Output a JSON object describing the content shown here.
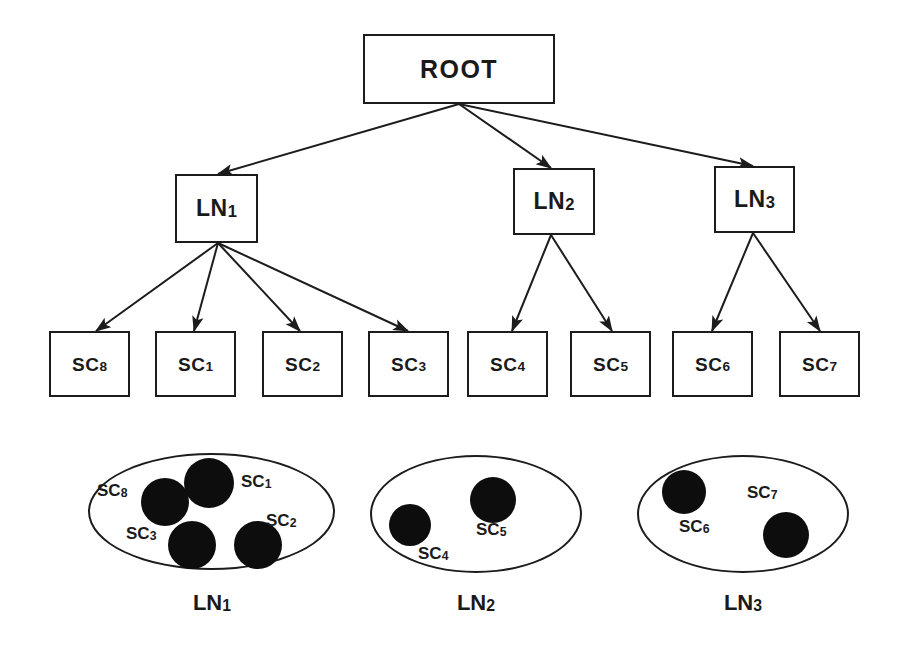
{
  "diagram": {
    "stroke_color": "#1c1c1c",
    "dot_color": "#0d0d0d",
    "background_color": "#ffffff"
  },
  "tree": {
    "root": {
      "id": "root",
      "label": "ROOT",
      "x": 363,
      "y": 34,
      "w": 192,
      "h": 70
    },
    "level_nodes": [
      {
        "id": "ln1",
        "label": "LN",
        "sub": "1",
        "x": 175,
        "y": 174,
        "w": 83,
        "h": 69
      },
      {
        "id": "ln2",
        "label": "LN",
        "sub": "2",
        "x": 513,
        "y": 168,
        "w": 82,
        "h": 67
      },
      {
        "id": "ln3",
        "label": "LN",
        "sub": "3",
        "x": 714,
        "y": 166,
        "w": 81,
        "h": 67
      }
    ],
    "service_components": [
      {
        "id": "sc8",
        "label": "SC",
        "sub": "8",
        "x": 49,
        "y": 331,
        "w": 81,
        "h": 66,
        "parent": "ln1"
      },
      {
        "id": "sc1",
        "label": "SC",
        "sub": "1",
        "x": 155,
        "y": 331,
        "w": 81,
        "h": 66,
        "parent": "ln1"
      },
      {
        "id": "sc2",
        "label": "SC",
        "sub": "2",
        "x": 262,
        "y": 331,
        "w": 81,
        "h": 66,
        "parent": "ln1"
      },
      {
        "id": "sc3",
        "label": "SC",
        "sub": "3",
        "x": 368,
        "y": 331,
        "w": 81,
        "h": 66,
        "parent": "ln1"
      },
      {
        "id": "sc4",
        "label": "SC",
        "sub": "4",
        "x": 467,
        "y": 331,
        "w": 81,
        "h": 66,
        "parent": "ln2"
      },
      {
        "id": "sc5",
        "label": "SC",
        "sub": "5",
        "x": 570,
        "y": 331,
        "w": 81,
        "h": 66,
        "parent": "ln2"
      },
      {
        "id": "sc6",
        "label": "SC",
        "sub": "6",
        "x": 672,
        "y": 331,
        "w": 81,
        "h": 66,
        "parent": "ln3"
      },
      {
        "id": "sc7",
        "label": "SC",
        "sub": "7",
        "x": 779,
        "y": 331,
        "w": 81,
        "h": 66,
        "parent": "ln3"
      }
    ],
    "edges": [
      {
        "from": "root",
        "to": "ln1",
        "x1": 459,
        "y1": 104,
        "x2": 218,
        "y2": 174
      },
      {
        "from": "root",
        "to": "ln2",
        "x1": 459,
        "y1": 104,
        "x2": 551,
        "y2": 168
      },
      {
        "from": "root",
        "to": "ln3",
        "x1": 459,
        "y1": 104,
        "x2": 753,
        "y2": 166
      },
      {
        "from": "ln1",
        "to": "sc8",
        "x1": 218,
        "y1": 243,
        "x2": 96,
        "y2": 331
      },
      {
        "from": "ln1",
        "to": "sc1",
        "x1": 218,
        "y1": 243,
        "x2": 194,
        "y2": 331
      },
      {
        "from": "ln1",
        "to": "sc2",
        "x1": 218,
        "y1": 243,
        "x2": 300,
        "y2": 331
      },
      {
        "from": "ln1",
        "to": "sc3",
        "x1": 218,
        "y1": 243,
        "x2": 408,
        "y2": 331
      },
      {
        "from": "ln2",
        "to": "sc4",
        "x1": 551,
        "y1": 235,
        "x2": 512,
        "y2": 331
      },
      {
        "from": "ln2",
        "to": "sc5",
        "x1": 551,
        "y1": 235,
        "x2": 612,
        "y2": 331
      },
      {
        "from": "ln3",
        "to": "sc6",
        "x1": 753,
        "y1": 233,
        "x2": 712,
        "y2": 331
      },
      {
        "from": "ln3",
        "to": "sc7",
        "x1": 753,
        "y1": 233,
        "x2": 820,
        "y2": 331
      }
    ]
  },
  "groups": [
    {
      "id": "group-ln1",
      "caption": "LN",
      "caption_sub": "1",
      "ellipse": {
        "x": 88,
        "y": 453,
        "w": 247,
        "h": 117
      },
      "caption_pos": {
        "x": 172,
        "y": 592,
        "w": 80
      },
      "members": [
        {
          "id": "sc8",
          "label": "SC",
          "sub": "8",
          "dot": {
            "cx": 165,
            "cy": 502,
            "r": 24
          },
          "label_pos": {
            "x": 97,
            "y": 482
          }
        },
        {
          "id": "sc1",
          "label": "SC",
          "sub": "1",
          "dot": {
            "cx": 209,
            "cy": 483,
            "r": 25
          },
          "label_pos": {
            "x": 241,
            "y": 473
          }
        },
        {
          "id": "sc3",
          "label": "SC",
          "sub": "3",
          "dot": {
            "cx": 192,
            "cy": 545,
            "r": 24
          },
          "label_pos": {
            "x": 126,
            "y": 525
          }
        },
        {
          "id": "sc2",
          "label": "SC",
          "sub": "2",
          "dot": {
            "cx": 258,
            "cy": 545,
            "r": 24
          },
          "label_pos": {
            "x": 266,
            "y": 512
          }
        }
      ]
    },
    {
      "id": "group-ln2",
      "caption": "LN",
      "caption_sub": "2",
      "ellipse": {
        "x": 370,
        "y": 455,
        "w": 212,
        "h": 118
      },
      "caption_pos": {
        "x": 436,
        "y": 592,
        "w": 80
      },
      "members": [
        {
          "id": "sc4",
          "label": "SC",
          "sub": "4",
          "dot": {
            "cx": 410,
            "cy": 525,
            "r": 21
          },
          "label_pos": {
            "x": 418,
            "y": 545
          }
        },
        {
          "id": "sc5",
          "label": "SC",
          "sub": "5",
          "dot": {
            "cx": 493,
            "cy": 500,
            "r": 23
          },
          "label_pos": {
            "x": 476,
            "y": 521
          }
        }
      ]
    },
    {
      "id": "group-ln3",
      "caption": "LN",
      "caption_sub": "3",
      "ellipse": {
        "x": 637,
        "y": 455,
        "w": 212,
        "h": 118
      },
      "caption_pos": {
        "x": 703,
        "y": 592,
        "w": 80
      },
      "members": [
        {
          "id": "sc6",
          "label": "SC",
          "sub": "6",
          "dot": {
            "cx": 684,
            "cy": 492,
            "r": 22
          },
          "label_pos": {
            "x": 679,
            "y": 518
          }
        },
        {
          "id": "sc7",
          "label": "SC",
          "sub": "7",
          "dot": {
            "cx": 786,
            "cy": 535,
            "r": 23
          },
          "label_pos": {
            "x": 747,
            "y": 484
          }
        }
      ]
    }
  ]
}
